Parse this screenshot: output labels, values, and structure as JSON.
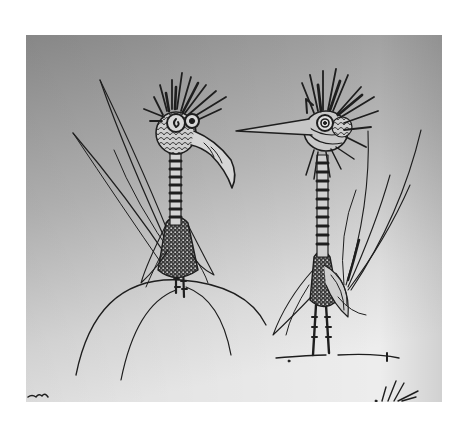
{
  "image": {
    "description": "Pen-and-ink drawing of two whimsical spiky-crested birds with striped necks and long feather tails; the left bird stands on a round dome",
    "subjects": [
      {
        "name": "left-bird",
        "features": [
          "spiky crest",
          "curled eye",
          "curved hooked beak",
          "scaly round head",
          "striped neck",
          "speckled body",
          "long tail feathers to the left",
          "standing on dome"
        ]
      },
      {
        "name": "right-bird",
        "features": [
          "spiky crest",
          "spiral eye",
          "long straight pointed beak facing left",
          "striped neck",
          "speckled body",
          "long tail feathers to the right",
          "standing on ground line"
        ]
      }
    ],
    "colors": {
      "page": "#ffffff",
      "paper_top": "#8f8f8f",
      "paper_bottom": "#ececec",
      "ink": "#1e1e1e"
    }
  }
}
